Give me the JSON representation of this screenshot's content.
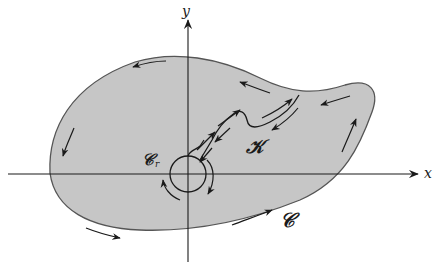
{
  "diagram": {
    "type": "contour-region",
    "colors": {
      "region_fill": "#c6c6c6",
      "region_stroke": "#555555",
      "axis": "#1a1a1a",
      "arrow": "#1a1a1a",
      "background": "#ffffff"
    },
    "axes": {
      "x_label": "x",
      "y_label": "y"
    },
    "labels": {
      "outer_curve": "𝒞",
      "small_circle": "𝒞",
      "small_circle_sub": "r",
      "cut": "𝒦"
    },
    "orientation": {
      "outer_curve": "counterclockwise",
      "small_circle": "clockwise",
      "cut": "two-way (traversed in both directions)"
    }
  }
}
